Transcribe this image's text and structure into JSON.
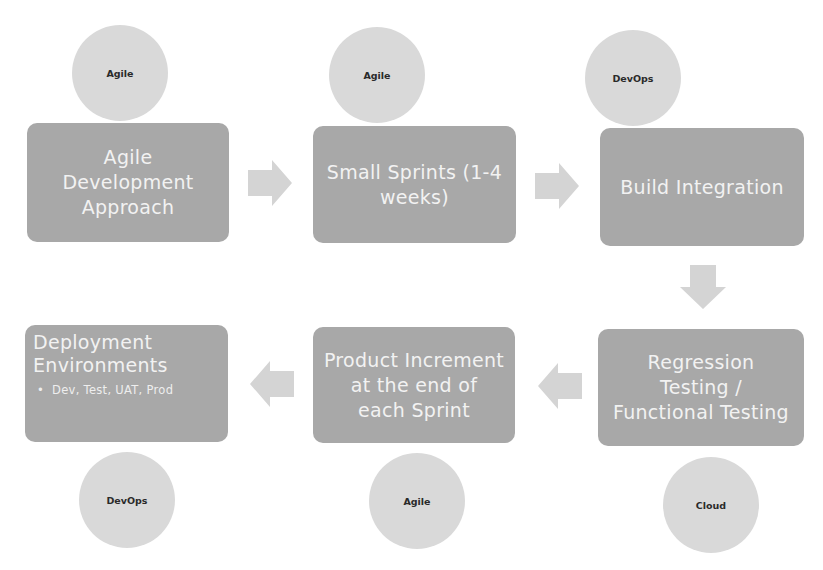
{
  "diagram": {
    "type": "process-flow",
    "colors": {
      "box_fill": "#a8a8a8",
      "box_text": "#f2f2f2",
      "circle_fill": "#d9d9d9",
      "circle_text": "#2a2a2a",
      "arrow_fill": "#d4d4d4"
    },
    "steps": [
      {
        "label": "Agile Development Approach",
        "lines": [
          "Agile",
          "Development",
          "Approach"
        ],
        "tag": "Agile"
      },
      {
        "label": "Small Sprints (1-4 weeks)",
        "lines": [
          "Small Sprints (1-4",
          "weeks)"
        ],
        "tag": "Agile"
      },
      {
        "label": "Build Integration",
        "lines": [
          "Build Integration"
        ],
        "tag": "DevOps"
      },
      {
        "label": "Regression Testing / Functional Testing",
        "lines": [
          "Regression",
          "Testing /",
          "Functional Testing"
        ],
        "tag": "Cloud"
      },
      {
        "label": "Product Increment at the end of each Sprint",
        "lines": [
          "Product Increment",
          "at the end of",
          "each Sprint"
        ],
        "tag": "Agile"
      },
      {
        "label": "Deployment Environments",
        "lines": [
          "Deployment",
          "Environments"
        ],
        "bullets": [
          "Dev, Test, UAT, Prod"
        ],
        "tag": "DevOps"
      }
    ],
    "arrows": [
      {
        "from": 1,
        "to": 2,
        "direction": "right"
      },
      {
        "from": 2,
        "to": 3,
        "direction": "right"
      },
      {
        "from": 3,
        "to": 4,
        "direction": "down"
      },
      {
        "from": 4,
        "to": 5,
        "direction": "left"
      },
      {
        "from": 5,
        "to": 6,
        "direction": "left"
      }
    ]
  }
}
